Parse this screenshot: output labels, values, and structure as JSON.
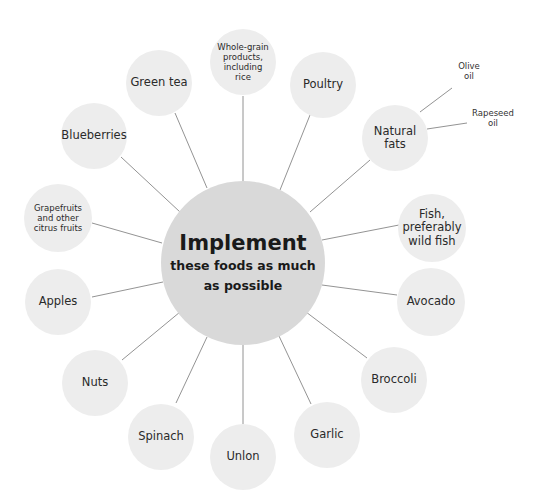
{
  "hub": {
    "title": "Implement",
    "subtitle_line1": "these foods as much",
    "subtitle_line2": "as possible"
  },
  "nodes": [
    {
      "label": "Whole-grain products, including rice"
    },
    {
      "label": "Poultry"
    },
    {
      "label": "Natural fats"
    },
    {
      "label": "Fish, preferably wild fish"
    },
    {
      "label": "Avocado"
    },
    {
      "label": "Broccoli"
    },
    {
      "label": "Garlic"
    },
    {
      "label": "Unlon"
    },
    {
      "label": "Spinach"
    },
    {
      "label": "Nuts"
    },
    {
      "label": "Apples"
    },
    {
      "label": "Grapefruits and other citrus fruits"
    },
    {
      "label": "Blueberries"
    },
    {
      "label": "Green tea"
    }
  ],
  "sub_nodes": [
    {
      "label_line1": "Olive",
      "label_line2": "oil"
    },
    {
      "label_line1": "Rapeseed",
      "label_line2": "oil"
    }
  ],
  "colors": {
    "hub": "#d9d9d9",
    "node": "#ededed",
    "line": "#777777"
  }
}
